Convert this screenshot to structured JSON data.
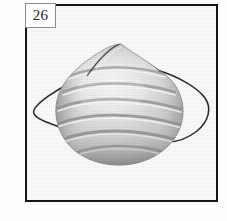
{
  "plate": {
    "figure_number": "26",
    "background_color": "#ffffff",
    "frame_color": "#161616",
    "label_border_color": "#8c8c8c"
  },
  "subject": {
    "name": "dust-mask-respirator",
    "description": "Pleated cone-style disposable dust mask with elastic head straps",
    "body_color_light": "#f2f2f2",
    "body_color_mid": "#c8c8c8",
    "body_color_dark": "#8e8e8e",
    "pleat_shadow_color": "#9a9a9a",
    "strap_color": "#2b2b2b",
    "seam_color": "#3a3a3a"
  }
}
